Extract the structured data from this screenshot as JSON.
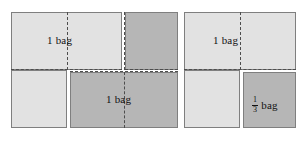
{
  "diagram": {
    "canvas": {
      "width": 305,
      "height": 141,
      "background": "#ffffff"
    },
    "colors": {
      "light_fill": "#e2e2e2",
      "dark_fill": "#b6b6b6",
      "outline": "#7f7f7f",
      "dashed_line": "#4d4d4d",
      "text": "#121212"
    },
    "groups": [
      {
        "name": "left-group",
        "shade": "light",
        "label": "1 bag",
        "parts": [
          {
            "name": "left-top-rect",
            "x": 11,
            "y": 12,
            "w": 111,
            "h": 58,
            "shade": "light"
          },
          {
            "name": "left-bottom-rect",
            "x": 11,
            "y": 70,
            "w": 56,
            "h": 58,
            "shade": "light"
          }
        ]
      },
      {
        "name": "middle-group",
        "shade": "dark",
        "label": "1 bag",
        "parts": [
          {
            "name": "middle-top-rect",
            "x": 125,
            "y": 12,
            "w": 53,
            "h": 58,
            "shade": "dark"
          },
          {
            "name": "middle-bottom-rect",
            "x": 70,
            "y": 72,
            "w": 108,
            "h": 56,
            "shade": "dark"
          }
        ]
      },
      {
        "name": "right-group",
        "shade": "light",
        "label": "1 bag",
        "parts": [
          {
            "name": "right-top-rect",
            "x": 184,
            "y": 12,
            "w": 112,
            "h": 58,
            "shade": "light"
          },
          {
            "name": "right-bottom-rect",
            "x": 184,
            "y": 70,
            "w": 56,
            "h": 58,
            "shade": "light"
          },
          {
            "name": "right-third-square",
            "x": 243,
            "y": 72,
            "w": 53,
            "h": 56,
            "shade": "dark"
          }
        ]
      }
    ],
    "labels": [
      {
        "name": "label-left-one-bag",
        "text": "1 bag",
        "x": 47,
        "y": 35
      },
      {
        "name": "label-middle-one-bag",
        "text": "1 bag",
        "x": 106,
        "y": 94
      },
      {
        "name": "label-right-one-bag",
        "text": "1 bag",
        "x": 213,
        "y": 35
      },
      {
        "name": "label-third-bag",
        "fraction": {
          "numerator": "1",
          "denominator": "3"
        },
        "unit": "bag",
        "x": 252,
        "y": 94
      }
    ],
    "guides": {
      "horizontal": [
        {
          "name": "dash-h-left",
          "x": 11,
          "y": 69,
          "length": 111
        },
        {
          "name": "dash-h-middle",
          "x": 125,
          "y": 69,
          "length": 53
        },
        {
          "name": "dash-h-middle-lower",
          "x": 70,
          "y": 72,
          "length": 108
        },
        {
          "name": "dash-h-right",
          "x": 184,
          "y": 69,
          "length": 112
        }
      ],
      "vertical": [
        {
          "name": "dash-v-left",
          "x": 67,
          "y": 12,
          "length": 58
        },
        {
          "name": "dash-v-middle-top",
          "x": 124,
          "y": 12,
          "length": 58
        },
        {
          "name": "dash-v-middle-bottom",
          "x": 124,
          "y": 72,
          "length": 56
        },
        {
          "name": "dash-v-right",
          "x": 240,
          "y": 12,
          "length": 58
        }
      ]
    }
  }
}
